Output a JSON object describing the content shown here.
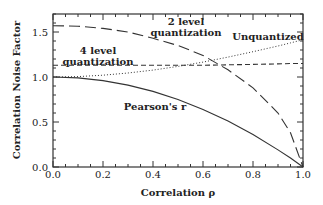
{
  "chart_data": {
    "type": "line",
    "title": "",
    "xlabel": "Correlation ρ",
    "ylabel": "Correlation Noise Factor",
    "xlim": [
      0.0,
      1.0
    ],
    "ylim": [
      0.0,
      1.7
    ],
    "grid": false,
    "legend": "none (inline annotations)",
    "x_ticks": [
      "0.0",
      "0.2",
      "0.4",
      "0.6",
      "0.8",
      "1.0"
    ],
    "y_ticks": [
      "0.0",
      "0.5",
      "1.0",
      "1.5"
    ],
    "x": [
      0.0,
      0.1,
      0.2,
      0.3,
      0.4,
      0.5,
      0.6,
      0.7,
      0.8,
      0.9,
      0.95,
      1.0
    ],
    "series": [
      {
        "name": "Pearson's r",
        "style": "solid",
        "values": [
          1.0,
          0.99,
          0.96,
          0.91,
          0.84,
          0.75,
          0.64,
          0.51,
          0.36,
          0.19,
          0.1,
          0.0
        ]
      },
      {
        "name": "Unquantized",
        "style": "dotted",
        "values": [
          1.0,
          1.005,
          1.02,
          1.044,
          1.077,
          1.118,
          1.166,
          1.221,
          1.281,
          1.345,
          1.379,
          1.414
        ]
      },
      {
        "name": "4 level quantization",
        "style": "short-dash",
        "values": [
          1.13,
          1.13,
          1.13,
          1.13,
          1.13,
          1.13,
          1.13,
          1.135,
          1.14,
          1.145,
          1.15,
          1.15
        ]
      },
      {
        "name": "2 level quantization",
        "style": "long-dash",
        "values": [
          1.57,
          1.565,
          1.54,
          1.5,
          1.43,
          1.35,
          1.24,
          1.08,
          0.88,
          0.6,
          0.38,
          0.0
        ]
      }
    ],
    "annotations": [
      {
        "text_lines": [
          "2 level",
          "quantization"
        ],
        "x": 0.53,
        "y": 1.53
      },
      {
        "text_lines": [
          "4 level",
          "quantization"
        ],
        "x": 0.11,
        "y": 1.2
      },
      {
        "text_lines": [
          "Unquantized"
        ],
        "x": 0.86,
        "y": 1.43
      },
      {
        "text_lines": [
          "Pearson's r"
        ],
        "x": 0.45,
        "y": 0.72
      }
    ]
  },
  "labels": {
    "xlabel": "Correlation ρ",
    "ylabel": "Correlation Noise Factor",
    "ann_2level_l1": "2 level",
    "ann_2level_l2": "quantization",
    "ann_4level_l1": "4 level",
    "ann_4level_l2": "quantization",
    "ann_unq": "Unquantized",
    "ann_pearson": "Pearson's r"
  }
}
